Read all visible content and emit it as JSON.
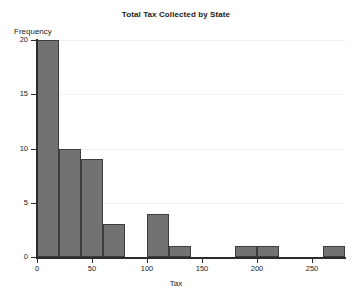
{
  "chart_data": {
    "type": "bar",
    "title": "Total Tax Collected by State",
    "xlabel": "Tax",
    "ylabel": "Frequency",
    "xlim": [
      0,
      280
    ],
    "ylim": [
      0,
      20
    ],
    "grid": true,
    "legend": null,
    "bin_width": 20,
    "xticks": [
      0,
      50,
      100,
      150,
      200,
      250
    ],
    "xtick_labels": [
      "0",
      "50",
      "100",
      "150",
      "200",
      "250"
    ],
    "yticks": [
      0,
      5,
      10,
      15,
      20
    ],
    "ytick_labels": [
      "0",
      "5",
      "10",
      "15",
      "20"
    ],
    "bin_edges": [
      0,
      20,
      40,
      60,
      80,
      100,
      120,
      140,
      160,
      180,
      200,
      220,
      240,
      260,
      280
    ],
    "categories": [
      "0-20",
      "20-40",
      "40-60",
      "60-80",
      "80-100",
      "100-120",
      "120-140",
      "140-160",
      "160-180",
      "180-200",
      "200-220",
      "220-240",
      "240-260",
      "260-280"
    ],
    "values": [
      20,
      10,
      9,
      3,
      0,
      4,
      1,
      0,
      0,
      1,
      1,
      0,
      0,
      1
    ],
    "bar_fill_color": "#727272",
    "bar_edge_color": "#3d3d3d",
    "gridline_color": "#f0f0f0",
    "axis_color": "#2b2b2b",
    "background_color": "#ffffff"
  }
}
